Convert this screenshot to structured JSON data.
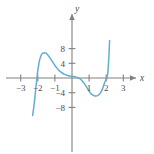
{
  "chart_data": {
    "type": "line",
    "title": "",
    "subtitle": "",
    "xlabel": "x",
    "ylabel": "y",
    "xlim": [
      -3.6,
      3.6
    ],
    "ylim": [
      -10.2,
      10.2
    ],
    "grid": false,
    "legend": null,
    "x_ticks": [
      -3,
      -2,
      -1,
      1,
      2,
      3
    ],
    "x_tick_labels": [
      "−3",
      "−2",
      "−1",
      "1",
      "2",
      "3"
    ],
    "y_ticks": [
      8,
      4,
      -4,
      -8
    ],
    "y_tick_labels": [
      "8",
      "4",
      "−4",
      "−8"
    ],
    "axis_color": "#808080",
    "curve_color": "#62aed0",
    "series": [
      {
        "name": "curve",
        "x": [
          -2.3,
          -2.2,
          -2.1,
          -2.05,
          -2.0,
          -1.9,
          -1.8,
          -1.7,
          -1.6,
          -1.5,
          -1.4,
          -1.3,
          -1.2,
          -1.1,
          -1.0,
          -0.9,
          -0.8,
          -0.7,
          -0.6,
          -0.5,
          -0.4,
          -0.3,
          -0.2,
          -0.1,
          0.0,
          0.1,
          0.2,
          0.3,
          0.4,
          0.5,
          0.6,
          0.7,
          0.8,
          0.9,
          1.0,
          1.1,
          1.2,
          1.3,
          1.4,
          1.5,
          1.6,
          1.7,
          1.8,
          1.9,
          2.0,
          2.05,
          2.1,
          2.15,
          2.2
        ],
        "y": [
          -10.2,
          -6.6,
          -2.1,
          0.0,
          2.0,
          4.8,
          6.2,
          6.75,
          6.85,
          6.7,
          6.2,
          5.55,
          4.85,
          4.1,
          3.4,
          2.8,
          2.25,
          1.8,
          1.45,
          1.15,
          0.92,
          0.75,
          0.62,
          0.52,
          0.45,
          0.38,
          0.28,
          0.15,
          -0.05,
          -0.35,
          -0.8,
          -1.4,
          -2.1,
          -2.85,
          -3.6,
          -4.2,
          -4.62,
          -4.82,
          -4.88,
          -4.8,
          -4.45,
          -3.8,
          -2.75,
          -1.35,
          -0.3,
          0.0,
          1.8,
          5.2,
          10.2
        ]
      }
    ],
    "features": {
      "x_intercepts": [
        -2.05,
        1.05,
        2.05
      ],
      "local_maximum": {
        "x": -1.55,
        "y": 6.85
      },
      "local_minimum": {
        "x": 1.45,
        "y": -4.88
      },
      "saddle_near_origin": {
        "x": 0.0,
        "y": 0.45
      }
    }
  },
  "axes": {
    "x_axis_name": "x",
    "y_axis_name": "y"
  }
}
